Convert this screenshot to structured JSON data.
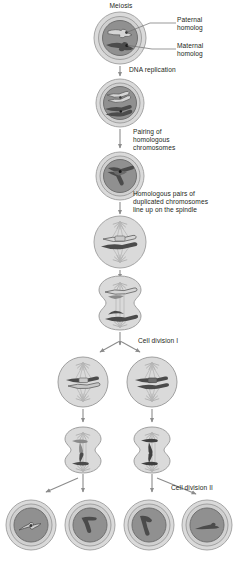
{
  "figure": {
    "title": "Meiosis",
    "domain": "biology-diagram",
    "palette": {
      "cytoplasm": "#d9d9d9",
      "cytoplasm_edge": "#9a9a9a",
      "nucleus": "#8f8f8f",
      "nucleus_edge": "#6f6f6f",
      "chromosome_dark": "#4a4a4a",
      "chromosome_light": "#cfcfcf",
      "chromosome_light_edge": "#6a6a6a",
      "spindle": "#b0b0b0",
      "arrow": "#808080",
      "text": "#231f20",
      "background": "#ffffff"
    }
  },
  "labels": {
    "title": "Meiosis",
    "paternal": "Paternal\nhomolog",
    "maternal": "Maternal\nhomolog",
    "dna_replication": "DNA replication",
    "pairing": "Pairing of\nhomologous\nchromosomes",
    "lineup": "Homologous pairs of\nduplicated chromosomes\nline up on the spindle",
    "cell_division_1": "Cell division I",
    "cell_division_2": "Cell division II"
  },
  "stages": [
    {
      "id": "stage-1-diploid-cell",
      "name": "diploid-parent-cell",
      "note": "Cell with one paternal (light) and one maternal (dark) homolog",
      "cx": 120,
      "cy": 38,
      "r": 26
    },
    {
      "id": "stage-2-replicated",
      "name": "cell-after-dna-replication",
      "note": "Chromosomes duplicated into sister chromatids",
      "cx": 120,
      "cy": 103,
      "r": 24
    },
    {
      "id": "stage-3-paired",
      "name": "cell-with-paired-homologs",
      "note": "Homologous chromosomes paired as bivalent",
      "cx": 120,
      "cy": 176,
      "r": 24
    },
    {
      "id": "stage-4-metaphase-1",
      "name": "cell-metaphase-one",
      "note": "Bivalents aligned on the spindle equator",
      "cx": 120,
      "cy": 242,
      "r": 26
    },
    {
      "id": "stage-5-anaphase-1",
      "name": "cell-anaphase-one",
      "note": "Dumbbell cell, homologs pulled to opposite poles",
      "cx": 120,
      "cy": 302,
      "r": 28
    },
    {
      "id": "stage-6-left-daughter",
      "name": "daughter-cell-left-metaphase-two",
      "note": "Left daughter cell, light chromosomes on spindle",
      "cx": 83,
      "cy": 382,
      "r": 25
    },
    {
      "id": "stage-6-right-daughter",
      "name": "daughter-cell-right-metaphase-two",
      "note": "Right daughter cell, dark chromosomes on spindle",
      "cx": 152,
      "cy": 382,
      "r": 25
    },
    {
      "id": "stage-7-left-anaphase-2",
      "name": "daughter-cell-left-anaphase-two",
      "note": "Left dumbbell cell splitting sister chromatids",
      "cx": 83,
      "cy": 452,
      "r": 24
    },
    {
      "id": "stage-7-right-anaphase-2",
      "name": "daughter-cell-right-anaphase-two",
      "note": "Right dumbbell cell splitting sister chromatids",
      "cx": 152,
      "cy": 452,
      "r": 24
    },
    {
      "id": "gamete-1",
      "name": "haploid-gamete-one",
      "note": "Haploid cell with light (paternal) chromosome",
      "cx": 31,
      "cy": 525,
      "r": 25
    },
    {
      "id": "gamete-2",
      "name": "haploid-gamete-two",
      "note": "Haploid cell with dark chromosome",
      "cx": 90,
      "cy": 525,
      "r": 25
    },
    {
      "id": "gamete-3",
      "name": "haploid-gamete-three",
      "note": "Haploid cell with dark chromosome",
      "cx": 149,
      "cy": 525,
      "r": 25
    },
    {
      "id": "gamete-4",
      "name": "haploid-gamete-four",
      "note": "Haploid cell with dark chromosome",
      "cx": 207,
      "cy": 525,
      "r": 25
    }
  ],
  "arrows": [
    {
      "id": "arrow-replication",
      "name": "arrow-dna-replication",
      "from": "stage-1",
      "to": "stage-2"
    },
    {
      "id": "arrow-pairing",
      "name": "arrow-pairing",
      "from": "stage-2",
      "to": "stage-3"
    },
    {
      "id": "arrow-lineup",
      "name": "arrow-lineup",
      "from": "stage-3",
      "to": "stage-4"
    },
    {
      "id": "arrow-anaphase",
      "name": "arrow-to-anaphase-one",
      "from": "stage-4",
      "to": "stage-5"
    },
    {
      "id": "arrow-split-1",
      "name": "arrow-cell-division-one-split",
      "from": "stage-5",
      "to": "daughters"
    },
    {
      "id": "arrow-left-2",
      "name": "arrow-left-to-anaphase-two",
      "from": "left-daughter",
      "to": "left-anaphase"
    },
    {
      "id": "arrow-right-2",
      "name": "arrow-right-to-anaphase-two",
      "from": "right-daughter",
      "to": "right-anaphase"
    },
    {
      "id": "arrow-split-2-left",
      "name": "arrow-cell-division-two-left-split",
      "from": "left-anaphase",
      "to": "gametes-1-2"
    },
    {
      "id": "arrow-split-2-right",
      "name": "arrow-cell-division-two-right-split",
      "from": "right-anaphase",
      "to": "gametes-3-4"
    }
  ]
}
